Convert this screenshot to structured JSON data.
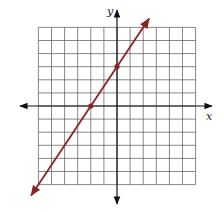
{
  "chart_data": {
    "type": "line",
    "title": "",
    "xlabel": "x",
    "ylabel": "y",
    "xlim": [
      -6,
      6
    ],
    "ylim": [
      -6,
      6
    ],
    "grid": true,
    "grid_step": 1,
    "tick_labels": false,
    "series": [
      {
        "name": "line",
        "equation": "y = 1.5x + 3",
        "slope": 1.5,
        "intercept": 3,
        "color": "#8b2323",
        "arrows_both_ends": true,
        "marked_points": [
          {
            "x": -2,
            "y": 0
          },
          {
            "x": 0,
            "y": 3
          }
        ]
      }
    ]
  },
  "colors": {
    "grid": "#555555",
    "axis": "#111111",
    "line": "#8b2323"
  },
  "labels": {
    "x_axis": "x",
    "y_axis": "y"
  }
}
